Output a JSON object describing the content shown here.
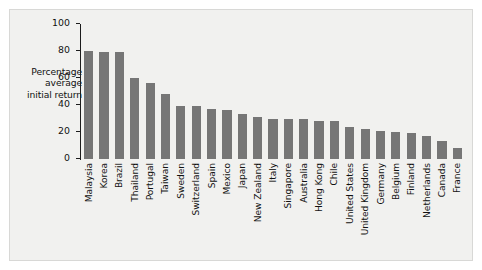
{
  "chart_data": {
    "type": "bar",
    "title": "",
    "subtitle": "",
    "xlabel": "",
    "ylabel": "Percentage average initial return",
    "ylabel_lines": [
      "Percentage",
      "average",
      "initial return"
    ],
    "ylim": [
      0,
      100
    ],
    "yticks": [
      0,
      20,
      40,
      60,
      80,
      100
    ],
    "ytick_labels": [
      "0",
      "20",
      "40",
      "60",
      "80",
      "100"
    ],
    "grid": false,
    "legend": "none",
    "bar_color": "#767676",
    "background_color": "#f1f1ef",
    "axis_color": "#1c1c1c",
    "xtick_label_rotation": 90,
    "categories": [
      "Malaysia",
      "Korea",
      "Brazil",
      "Thailand",
      "Portugal",
      "Taiwan",
      "Sweden",
      "Switzerland",
      "Spain",
      "Mexico",
      "Japan",
      "New Zealand",
      "Italy",
      "Singapore",
      "Australia",
      "Hong Kong",
      "Chile",
      "United States",
      "United Kingdom",
      "Germany",
      "Belgium",
      "Finland",
      "Netherlands",
      "Canada",
      "France"
    ],
    "values": [
      80,
      79,
      79,
      60,
      56,
      48,
      39,
      39,
      37,
      36,
      33,
      31,
      30,
      30,
      30,
      28,
      28,
      24,
      22,
      21,
      20,
      19,
      17,
      13,
      8
    ]
  }
}
